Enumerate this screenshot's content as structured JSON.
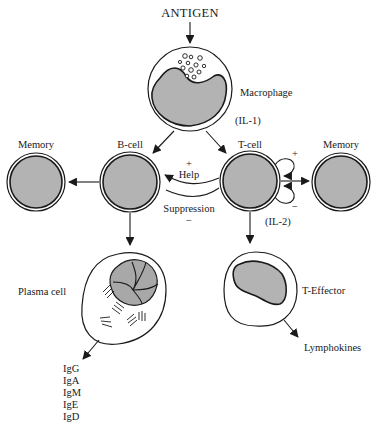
{
  "title": "ANTIGEN",
  "nodes": {
    "macrophage": {
      "label": "Macrophage",
      "cytokine": "(IL-1)"
    },
    "b_cell": {
      "label": "B-cell"
    },
    "t_cell": {
      "label": "T-cell",
      "cytokine": "(IL-2)",
      "feedback_plus": "+",
      "feedback_minus": "−"
    },
    "memory_left": {
      "label": "Memory"
    },
    "memory_right": {
      "label": "Memory"
    },
    "plasma_cell": {
      "label": "Plasma cell"
    },
    "t_effector": {
      "label": "T-Effector"
    }
  },
  "interactions": {
    "help": {
      "label": "Help",
      "sign": "+"
    },
    "suppression": {
      "label": "Suppression",
      "sign": "−"
    }
  },
  "outputs": {
    "lymphokines": "Lymphokines",
    "immunoglobulins": [
      "IgG",
      "IgA",
      "IgM",
      "IgE",
      "IgD"
    ]
  },
  "colors": {
    "ink": "#1a1a1a",
    "cell_fill": "#b3b3b3",
    "background": "#ffffff"
  }
}
